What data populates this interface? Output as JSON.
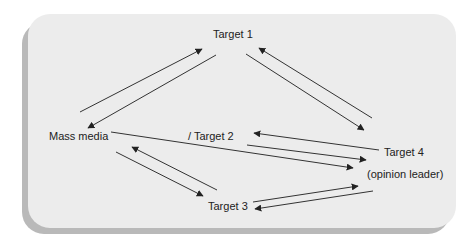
{
  "diagram": {
    "nodes": [
      {
        "id": "target1",
        "label": "Target 1",
        "x": 213,
        "y": 38
      },
      {
        "id": "mass_media",
        "label": "Mass media",
        "x": 49,
        "y": 140
      },
      {
        "id": "target2",
        "label": "/ Target 2",
        "x": 188,
        "y": 140
      },
      {
        "id": "target4",
        "label": "Target 4",
        "x": 384,
        "y": 156
      },
      {
        "id": "opinion_leader",
        "label": "(opinion leader)",
        "x": 367,
        "y": 178
      },
      {
        "id": "target3",
        "label": "Target 3",
        "x": 208,
        "y": 210
      }
    ],
    "edges": [
      {
        "from": "mass_media",
        "to": "target1",
        "x1": 80,
        "y1": 112,
        "x2": 202,
        "y2": 49
      },
      {
        "from": "target1",
        "to": "mass_media",
        "x1": 216,
        "y1": 55,
        "x2": 88,
        "y2": 128
      },
      {
        "from": "target4",
        "to": "target1",
        "x1": 372,
        "y1": 118,
        "x2": 259,
        "y2": 48
      },
      {
        "from": "target1",
        "to": "target4",
        "x1": 246,
        "y1": 54,
        "x2": 364,
        "y2": 130
      },
      {
        "from": "target3",
        "to": "mass_media",
        "x1": 217,
        "y1": 190,
        "x2": 132,
        "y2": 147
      },
      {
        "from": "mass_media",
        "to": "target3",
        "x1": 116,
        "y1": 152,
        "x2": 203,
        "y2": 196
      },
      {
        "from": "target3",
        "to": "target4",
        "x1": 253,
        "y1": 202,
        "x2": 358,
        "y2": 186
      },
      {
        "from": "target4",
        "to": "target3",
        "x1": 373,
        "y1": 191,
        "x2": 255,
        "y2": 209
      },
      {
        "from": "mass_media",
        "to": "target4",
        "x1": 111,
        "y1": 132,
        "x2": 353,
        "y2": 168
      },
      {
        "from": "target4",
        "to": "target2",
        "x1": 379,
        "y1": 150,
        "x2": 254,
        "y2": 133
      },
      {
        "from": "target2",
        "to": "target4",
        "x1": 247,
        "y1": 145,
        "x2": 366,
        "y2": 160
      }
    ],
    "colors": {
      "panel": "#ececec",
      "shadow": "#b9b9b9",
      "line": "#333333",
      "text": "#222222"
    }
  }
}
